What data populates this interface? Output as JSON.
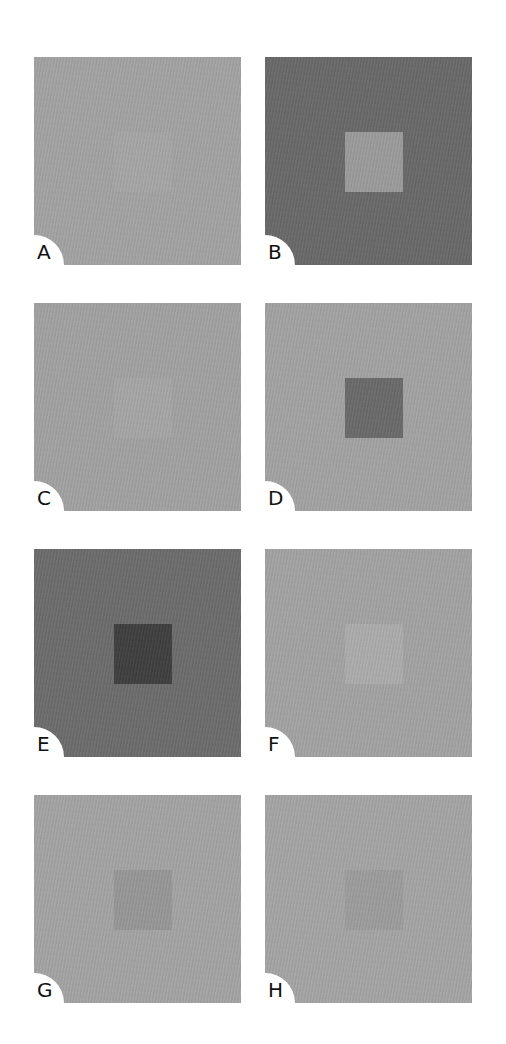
{
  "figure": {
    "panels": [
      {
        "label": "A",
        "background": "#a2a2a2",
        "square": "#a5a5a5",
        "square_visible": "very faint (texture only)"
      },
      {
        "label": "B",
        "background": "#696969",
        "square": "#9a9a9a",
        "square_visible": "clear, lighter"
      },
      {
        "label": "C",
        "background": "#a1a1a1",
        "square": "#a5a5a5",
        "square_visible": "very faint"
      },
      {
        "label": "D",
        "background": "#a2a2a2",
        "square": "#6a6a6a",
        "square_visible": "clear, darker"
      },
      {
        "label": "E",
        "background": "#6c6c6c",
        "square": "#3f3f3f",
        "square_visible": "clear, darker"
      },
      {
        "label": "F",
        "background": "#a2a2a2",
        "square": "#ababab",
        "square_visible": "faint, lighter"
      },
      {
        "label": "G",
        "background": "#a3a3a3",
        "square": "#969696",
        "square_visible": "faint, darker"
      },
      {
        "label": "H",
        "background": "#a4a4a4",
        "square": "#9c9c9c",
        "square_visible": "very faint, darker"
      }
    ]
  }
}
